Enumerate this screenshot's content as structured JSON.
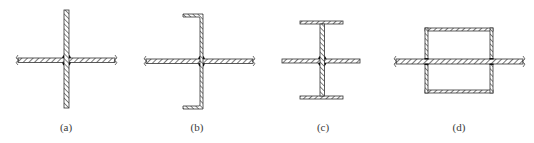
{
  "figure": {
    "type": "structural-cross-sections",
    "panels": [
      {
        "id": "a",
        "label": "(a)",
        "description": "plate with perpendicular plate through center, welded joint"
      },
      {
        "id": "b",
        "label": "(b)",
        "description": "channel (C) section crossing plate, welded joint"
      },
      {
        "id": "c",
        "label": "(c)",
        "description": "I-section crossing plate, welded joint"
      },
      {
        "id": "d",
        "label": "(d)",
        "description": "rectangular hollow (box) section with plate passing through"
      }
    ],
    "colors": {
      "stroke": "#333333",
      "hatch": "#555555",
      "weld": "#111111",
      "background": "#ffffff"
    }
  }
}
